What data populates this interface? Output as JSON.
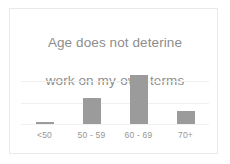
{
  "chart_data": {
    "type": "bar",
    "title": "Age does not deterine work on my-own-terms",
    "title_lines": [
      "Age does not deterine",
      "work on my-own-terms"
    ],
    "categories": [
      "<50",
      "50 - 59",
      "60 - 69",
      "70+"
    ],
    "values": [
      1,
      12,
      23,
      6
    ],
    "xlabel": "",
    "ylabel": "",
    "ylim": [
      0,
      30
    ],
    "grid": true,
    "gridlines": [
      20,
      10
    ],
    "legend": false,
    "legend_position": "none",
    "bar_color": "#9b9b9b",
    "gridline_color": "#f0f0f0",
    "title_color": "#8d8d8d",
    "label_color": "#969696",
    "background_color": "#ffffff",
    "border_color": "#e9e9e9",
    "y_tick_labels": [],
    "data_labels": []
  }
}
